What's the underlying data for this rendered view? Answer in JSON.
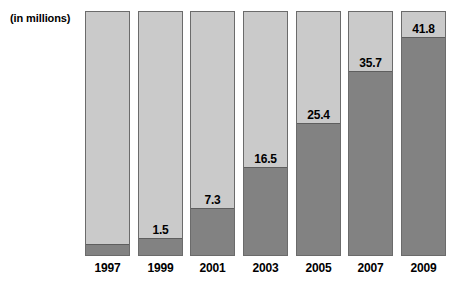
{
  "units_note": "(in millions)",
  "chart_data": {
    "type": "bar",
    "title": "",
    "subtitle": "",
    "xlabel": "",
    "ylabel": "(in millions)",
    "units": "millions",
    "grid": false,
    "legend": "none",
    "axis_line": false,
    "ylim": [
      0,
      45
    ],
    "categories": [
      "1997",
      "1999",
      "2001",
      "2003",
      "2005",
      "2007",
      "2009"
    ],
    "values": [
      0.5,
      1.5,
      7.3,
      16.5,
      25.4,
      35.7,
      41.8
    ],
    "labels": [
      "",
      "1.5",
      "7.3",
      "16.5",
      "25.4",
      "35.7",
      "41.8"
    ],
    "bars": [
      {
        "category": "1997",
        "value": 0.5,
        "label": "",
        "fill_pct": 4.5
      },
      {
        "category": "1999",
        "value": 1.5,
        "label": "1.5",
        "fill_pct": 7.0
      },
      {
        "category": "2001",
        "value": 7.3,
        "label": "7.3",
        "fill_pct": 19.0
      },
      {
        "category": "2003",
        "value": 16.5,
        "label": "16.5",
        "fill_pct": 36.0
      },
      {
        "category": "2005",
        "value": 25.4,
        "label": "25.4",
        "fill_pct": 54.0
      },
      {
        "category": "2007",
        "value": 35.7,
        "label": "35.7",
        "fill_pct": 75.0
      },
      {
        "category": "2009",
        "value": 41.8,
        "label": "41.8",
        "fill_pct": 89.0
      }
    ],
    "colors": {
      "bar_fill": "#828282",
      "bar_track": "#cacaca",
      "bar_border": "#6b6b6b",
      "text": "#000000",
      "background": "#ffffff"
    }
  }
}
